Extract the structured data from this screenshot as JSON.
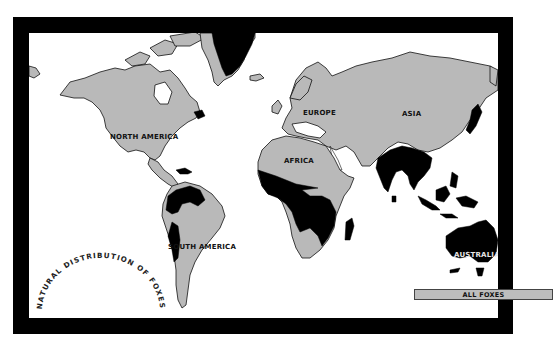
{
  "map": {
    "title": "NATURAL DISTRIBUTION OF FOXES",
    "regions": [
      {
        "name": "NORTH AMERICA"
      },
      {
        "name": "SOUTH AMERICA"
      },
      {
        "name": "EUROPE"
      },
      {
        "name": "AFRICA"
      },
      {
        "name": "ASIA"
      },
      {
        "name": "AUSTRALIA"
      }
    ],
    "legend": {
      "label": "ALL FOXES",
      "color": "#bdbdbd"
    },
    "colors": {
      "land": "#b9b9b9",
      "no_foxes": "#000000",
      "ocean": "#ffffff",
      "frame": "#000000"
    }
  }
}
